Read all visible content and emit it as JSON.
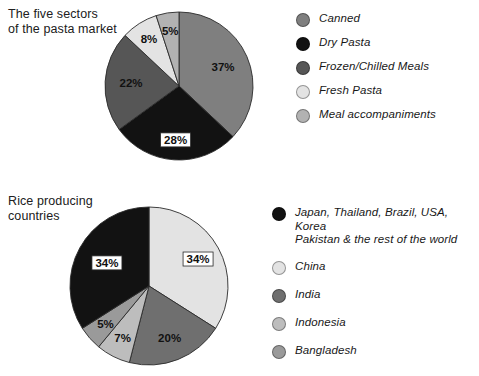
{
  "page": {
    "background": "#ffffff",
    "width": 479,
    "height": 376
  },
  "charts": {
    "pasta": {
      "title": "The five sectors\nof the pasta market",
      "legend": [
        {
          "label": "Canned",
          "color": "#7f7f7f"
        },
        {
          "label": "Dry Pasta",
          "color": "#121212"
        },
        {
          "label": "Frozen/Chilled Meals",
          "color": "#565656"
        },
        {
          "label": "Fresh Pasta",
          "color": "#e3e3e3"
        },
        {
          "label": "Meal accompaniments",
          "color": "#b2b2b2"
        }
      ]
    },
    "rice": {
      "title": "Rice producing\ncountries",
      "legend": [
        {
          "label": "Japan, Thailand, Brazil, USA, Korea\nPakistan & the rest of the world",
          "color": "#121212"
        },
        {
          "label": "China",
          "color": "#e3e3e3"
        },
        {
          "label": "India",
          "color": "#6f6f6f"
        },
        {
          "label": "Indonesia",
          "color": "#bdbdbd"
        },
        {
          "label": "Bangladesh",
          "color": "#9a9a9a"
        }
      ]
    }
  },
  "chart_data": [
    {
      "type": "pie",
      "title": "The five sectors of the pasta market",
      "legend_position": "right",
      "categories": [
        "Canned",
        "Dry Pasta",
        "Frozen/Chilled Meals",
        "Fresh Pasta",
        "Meal accompaniments"
      ],
      "values": [
        37,
        28,
        22,
        8,
        5
      ],
      "value_labels": [
        "37%",
        "28%",
        "22%",
        "8%",
        "5%"
      ],
      "colors": [
        "#7f7f7f",
        "#121212",
        "#565656",
        "#e3e3e3",
        "#b2b2b2"
      ],
      "units": "percent",
      "start_angle_deg": 0,
      "direction": "clockwise",
      "boxed_labels": [
        "28%"
      ]
    },
    {
      "type": "pie",
      "title": "Rice producing countries",
      "legend_position": "right",
      "categories": [
        "China",
        "India",
        "Indonesia",
        "Bangladesh",
        "Japan, Thailand, Brazil, USA, Korea Pakistan & the rest of the world"
      ],
      "values": [
        34,
        20,
        7,
        5,
        34
      ],
      "value_labels": [
        "34%",
        "20%",
        "7%",
        "5%",
        "34%"
      ],
      "colors": [
        "#e3e3e3",
        "#6f6f6f",
        "#bdbdbd",
        "#9a9a9a",
        "#121212"
      ],
      "units": "percent",
      "start_angle_deg": 0,
      "direction": "clockwise",
      "boxed_labels": [
        "34%"
      ]
    }
  ]
}
